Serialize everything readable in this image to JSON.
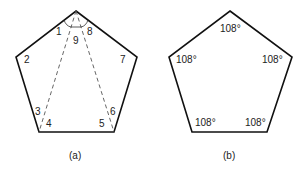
{
  "figure_a": {
    "caption": "(a)",
    "angle_labels": [
      "1",
      "2",
      "3",
      "4",
      "5",
      "6",
      "7",
      "8",
      "9"
    ]
  },
  "figure_b": {
    "caption": "(b)",
    "angle_labels": [
      "108°",
      "108°",
      "108°",
      "108°",
      "108°"
    ]
  },
  "colors": {
    "stroke": "#111111",
    "text": "#222222"
  }
}
